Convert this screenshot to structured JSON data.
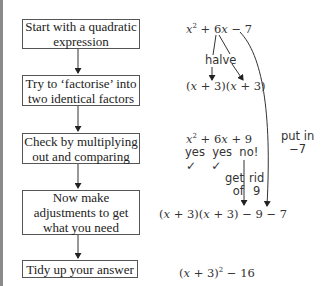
{
  "flow_steps": [
    {
      "line1": "Start with a quadratic",
      "line2": "expression"
    },
    {
      "line1": "Try to ‘factorise’ into",
      "line2": "two identical factors"
    },
    {
      "line1": "Check by multiplying",
      "line2": "out and comparing"
    },
    {
      "line1": "Now make",
      "line2": "adjustments to get",
      "line3": "what you need"
    },
    {
      "line1": "Tidy up your answer"
    }
  ],
  "worked": {
    "expr1": {
      "x": "x",
      "sq": "2",
      "rest": " + 6",
      "x2": "x",
      "tail": " − 7"
    },
    "halve": "halve",
    "factors": {
      "open": "(",
      "x": "x",
      "mid": " + 3)(",
      "x2": "x",
      "close": " + 3)"
    },
    "expand": {
      "x": "x",
      "sq": "2",
      "rest": " + 6",
      "x2": "x",
      "tail": " + 9"
    },
    "compare": "yes  yes  no!",
    "ticks": "✓    ✓",
    "get_of": {
      "line1": "get",
      "line2": "of"
    },
    "rid_9": {
      "line1": "rid",
      "line2": "9"
    },
    "put_in": {
      "line1": "put in",
      "line2": "−7"
    },
    "adjusted": {
      "open": "(",
      "x": "x",
      "mid": " + 3)(",
      "x2": "x",
      "close": " + 3) − 9 − 7"
    },
    "final": {
      "open": "(",
      "x": "x",
      "mid": " + 3)",
      "sq": "2",
      "tail": " − 16"
    }
  }
}
